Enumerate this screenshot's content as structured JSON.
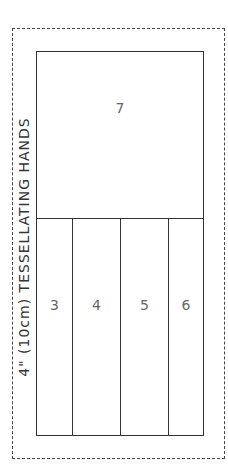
{
  "title": "4\" (10cm) TESSELLATING HANDS",
  "pieces": {
    "top": {
      "label": "7"
    },
    "strips": [
      {
        "label": "3",
        "width": 36
      },
      {
        "label": "4",
        "width": 48
      },
      {
        "label": "5",
        "width": 48
      },
      {
        "label": "6",
        "width": 36
      }
    ]
  },
  "colors": {
    "line": "#333333",
    "label": "#666666",
    "background": "#ffffff"
  }
}
